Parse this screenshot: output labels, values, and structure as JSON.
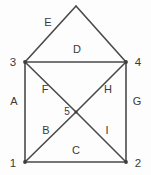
{
  "figure": {
    "background_color": "#fdfdfd",
    "line_color": "#4a4a4a",
    "text_color": "#3a3a3a",
    "width": 151,
    "height": 175
  },
  "vertices": [
    {
      "id": "v1",
      "label": "1",
      "x": 25,
      "y": 162,
      "label_x": 13,
      "label_y": 163,
      "shown": true
    },
    {
      "id": "v2",
      "label": "2",
      "x": 126,
      "y": 162,
      "label_x": 138,
      "label_y": 163,
      "shown": true
    },
    {
      "id": "v3",
      "label": "3",
      "x": 25,
      "y": 62,
      "label_x": 13,
      "label_y": 62,
      "shown": true
    },
    {
      "id": "v4",
      "label": "4",
      "x": 126,
      "y": 62,
      "label_x": 138,
      "label_y": 62,
      "shown": true
    },
    {
      "id": "v5",
      "label": "5",
      "x": 76,
      "y": 112,
      "label_x": 67,
      "label_y": 111,
      "shown": true
    },
    {
      "id": "apex",
      "label": "",
      "x": 76,
      "y": 6,
      "label_x": 76,
      "label_y": 6,
      "shown": false
    }
  ],
  "edges": [
    {
      "id": "A",
      "label": "A",
      "from": "v3",
      "to": "v1",
      "label_x": 14,
      "label_y": 101
    },
    {
      "id": "B",
      "label": "B",
      "from": "v1",
      "to": "v5",
      "label_x": 46,
      "label_y": 130
    },
    {
      "id": "C",
      "label": "C",
      "from": "v1",
      "to": "v2",
      "label_x": 76,
      "label_y": 150
    },
    {
      "id": "D",
      "label": "D",
      "from": "v3",
      "to": "v4",
      "label_x": 77,
      "label_y": 49
    },
    {
      "id": "E",
      "label": "E",
      "from": "v3",
      "to": "apex",
      "label_x": 48,
      "label_y": 22
    },
    {
      "id": "F",
      "label": "F",
      "from": "v3",
      "to": "v5",
      "label_x": 45,
      "label_y": 89
    },
    {
      "id": "G",
      "label": "G",
      "from": "v4",
      "to": "v2",
      "label_x": 137,
      "label_y": 101
    },
    {
      "id": "H",
      "label": "H",
      "from": "v4",
      "to": "v5",
      "label_x": 108,
      "label_y": 89
    },
    {
      "id": "I",
      "label": "I",
      "from": "v5",
      "to": "v2",
      "label_x": 107,
      "label_y": 130
    },
    {
      "id": "Eapex",
      "label": "",
      "from": "apex",
      "to": "v4",
      "label_x": 104,
      "label_y": 28
    }
  ]
}
